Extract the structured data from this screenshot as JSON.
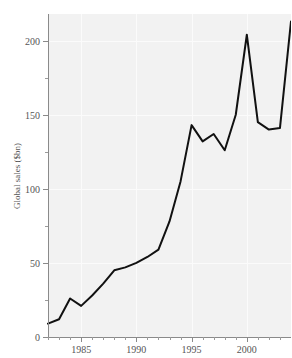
{
  "chart_data": {
    "type": "line",
    "title": "",
    "xlabel": "",
    "ylabel": "Global sales ($bn)",
    "xlim": [
      1982,
      2004
    ],
    "ylim": [
      0,
      218
    ],
    "grid": true,
    "legend": "none",
    "x_tick_labels": [
      "1985",
      "1990",
      "1995",
      "2000"
    ],
    "x_tick_values": [
      1985,
      1990,
      1995,
      2000
    ],
    "x_minor_tick_interval": 1,
    "y_tick_labels": [
      "0",
      "50",
      "100",
      "150",
      "200"
    ],
    "y_tick_values": [
      0,
      50,
      100,
      150,
      200
    ],
    "y_minor_tick_values": [
      25,
      75,
      125,
      175
    ],
    "x": [
      1982,
      1983,
      1984,
      1985,
      1986,
      1987,
      1988,
      1989,
      1990,
      1991,
      1992,
      1993,
      1994,
      1995,
      1996,
      1997,
      1998,
      1999,
      2000,
      2001,
      2002,
      2003,
      2004
    ],
    "values": [
      9,
      12,
      26,
      21,
      28,
      36,
      45,
      47,
      50,
      54,
      59,
      78,
      105,
      143,
      132,
      137,
      126,
      150,
      204,
      145,
      140,
      141,
      213
    ],
    "series": [
      {
        "name": "Global sales",
        "color": "#111111",
        "values": [
          9,
          12,
          26,
          21,
          28,
          36,
          45,
          47,
          50,
          54,
          59,
          78,
          105,
          143,
          132,
          137,
          126,
          150,
          204,
          145,
          140,
          141,
          213
        ]
      }
    ],
    "annotations": []
  },
  "style": {
    "panel_background": "#f2f2f2",
    "figure_background": "#ffffff",
    "axis_color": "#8a8a8a",
    "text_color": "#555555",
    "line_color": "#111111"
  }
}
